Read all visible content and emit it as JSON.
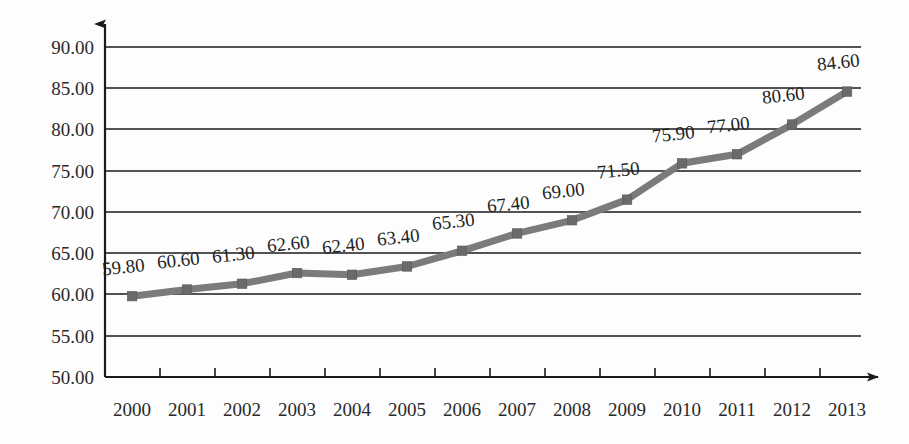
{
  "chart_data": {
    "type": "line",
    "title": "",
    "subtitle": "",
    "xlabel": "",
    "ylabel": "",
    "categories": [
      "2000",
      "2001",
      "2002",
      "2003",
      "2004",
      "2005",
      "2006",
      "2007",
      "2008",
      "2009",
      "2010",
      "2011",
      "2012",
      "2013"
    ],
    "values": [
      59.8,
      60.6,
      61.3,
      62.6,
      62.4,
      63.4,
      65.3,
      67.4,
      69.0,
      71.5,
      75.9,
      77.0,
      80.6,
      84.6
    ],
    "point_labels": [
      "59.80",
      "60.60",
      "61.30",
      "62.60",
      "62.40",
      "63.40",
      "65.30",
      "67.40",
      "69.00",
      "71.50",
      "75.90",
      "77.00",
      "80.60",
      "84.60"
    ],
    "ylim": [
      50.0,
      90.0
    ],
    "ytick_values": [
      90.0,
      85.0,
      80.0,
      75.0,
      70.0,
      65.0,
      60.0,
      55.0,
      50.0
    ],
    "ytick_labels": [
      "90.00",
      "85.00",
      "80.00",
      "75.00",
      "70.00",
      "65.00",
      "60.00",
      "55.00",
      "50.00"
    ],
    "grid": true,
    "legend": false,
    "legend_position": "none",
    "series_name": "",
    "marker": "square",
    "colors": {
      "line": "#7b7b7b",
      "marker": "#6a6a6a",
      "axis": "#1a1a1a",
      "grid": "#1a1a1a",
      "text": "#2a2a2a",
      "background": "#fdfdfd"
    },
    "axis_arrows": {
      "x": true,
      "y": true
    },
    "label_rotation_deg": -6
  }
}
